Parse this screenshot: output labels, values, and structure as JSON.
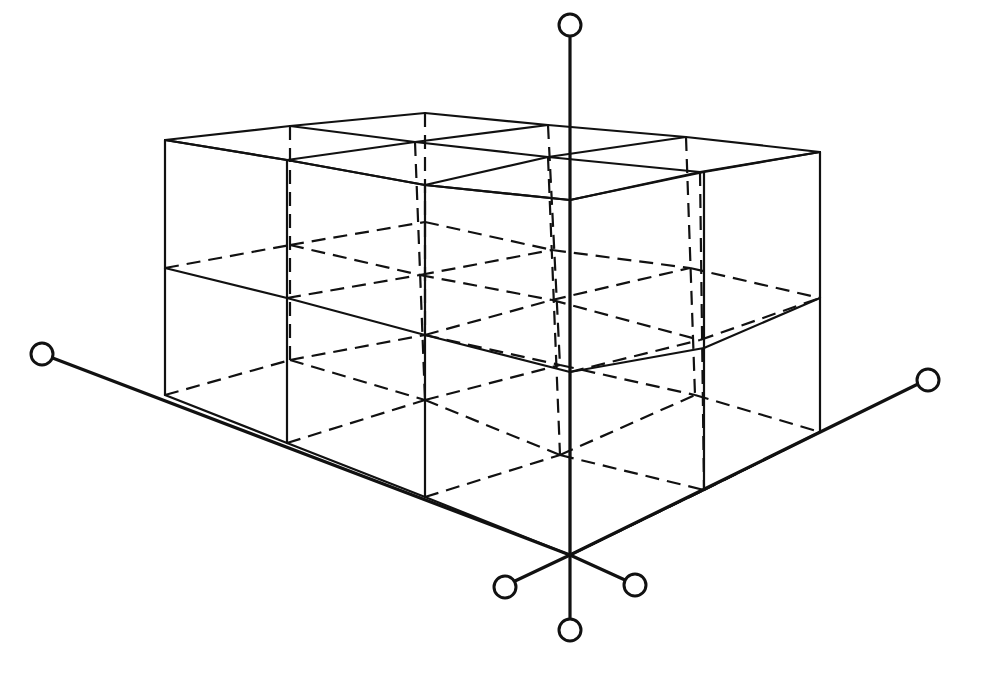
{
  "diagram": {
    "title": "",
    "grid_cells": {
      "along_left_axis": 3,
      "along_right_axis": 2,
      "vertical": 2
    },
    "nodes": [
      "left-axis-end",
      "right-axis-end",
      "top-axis-end",
      "lower-left-spoke",
      "lower-right-spoke",
      "bottom-axis-end"
    ],
    "colors": {
      "line": "#111111",
      "background": "#ffffff"
    }
  }
}
